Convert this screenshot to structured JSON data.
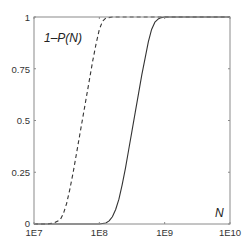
{
  "chart_data": {
    "type": "line",
    "title": "",
    "xlabel": "N",
    "ylabel": "1–P(N)",
    "xscale": "log",
    "xlim": [
      10000000.0,
      10000000000.0
    ],
    "ylim": [
      0,
      1
    ],
    "grid": false,
    "legend": null,
    "x_ticks": [
      "1E7",
      "1E8",
      "1E9",
      "1E10"
    ],
    "y_ticks": [
      "0",
      "0.25",
      "0.5",
      "0.75",
      "1"
    ],
    "annotations": [
      {
        "text": "1–P(N)",
        "position": "top-left inside"
      },
      {
        "text": "N",
        "position": "bottom-right inside"
      }
    ],
    "series": [
      {
        "name": "dashed",
        "style": "dashed",
        "color": "#333333",
        "log10_x": [
          7.0,
          7.2,
          7.3,
          7.4,
          7.45,
          7.5,
          7.55,
          7.6,
          7.65,
          7.7,
          7.75,
          7.8,
          7.85,
          7.9,
          7.95,
          8.0,
          8.05,
          8.1,
          8.2,
          8.4,
          10.0
        ],
        "y": [
          0.0,
          0.0,
          0.005,
          0.02,
          0.05,
          0.1,
          0.17,
          0.25,
          0.34,
          0.43,
          0.52,
          0.61,
          0.7,
          0.79,
          0.87,
          0.94,
          0.98,
          0.995,
          1.0,
          1.0,
          1.0
        ]
      },
      {
        "name": "solid",
        "style": "solid",
        "color": "#333333",
        "log10_x": [
          7.0,
          8.0,
          8.1,
          8.15,
          8.2,
          8.25,
          8.3,
          8.35,
          8.4,
          8.45,
          8.5,
          8.55,
          8.6,
          8.65,
          8.7,
          8.75,
          8.8,
          8.85,
          8.9,
          8.95,
          9.0,
          9.1,
          10.0
        ],
        "y": [
          0.0,
          0.0,
          0.005,
          0.015,
          0.035,
          0.07,
          0.12,
          0.19,
          0.27,
          0.36,
          0.45,
          0.54,
          0.63,
          0.72,
          0.8,
          0.88,
          0.94,
          0.975,
          0.99,
          0.997,
          1.0,
          1.0,
          1.0
        ]
      }
    ]
  },
  "axes": {
    "x_tick_labels": [
      "1E7",
      "1E8",
      "1E9",
      "1E10"
    ],
    "y_tick_labels": [
      "0",
      "0.25",
      "0.5",
      "0.75",
      "1"
    ],
    "ylabel_annotation": "1–P(N)",
    "xlabel_annotation": "N"
  }
}
